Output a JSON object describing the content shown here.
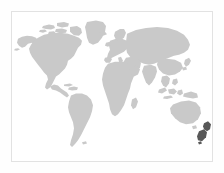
{
  "widget": {
    "name": "world-map-thumbnail",
    "type": "map",
    "projection": "equirectangular",
    "background_color": "#ffffff",
    "outer_background_color": "#fefefe",
    "border_color": "#e2e2e2",
    "border_width_px": 1,
    "frame": {
      "x": 11,
      "y": 11,
      "width": 202,
      "height": 151
    },
    "canvas": {
      "width": 224,
      "height": 173
    }
  },
  "map": {
    "land_color": "#c9c9c9",
    "highlight_color": "#585858",
    "ocean_color": "#ffffff",
    "graticule_visible": false,
    "labels_visible": false,
    "legend_visible": false,
    "regions": [
      {
        "id": "north-america",
        "label": "North America",
        "highlighted": false
      },
      {
        "id": "greenland",
        "label": "Greenland",
        "highlighted": false
      },
      {
        "id": "canadian-arctic",
        "label": "Canadian Arctic Archipelago",
        "highlighted": false
      },
      {
        "id": "south-america",
        "label": "South America",
        "highlighted": false
      },
      {
        "id": "africa",
        "label": "Africa",
        "highlighted": false
      },
      {
        "id": "europe",
        "label": "Europe",
        "highlighted": false
      },
      {
        "id": "asia",
        "label": "Asia",
        "highlighted": false
      },
      {
        "id": "india",
        "label": "India",
        "highlighted": false
      },
      {
        "id": "southeast-asia",
        "label": "Southeast Asia",
        "highlighted": false
      },
      {
        "id": "indonesia",
        "label": "Indonesia",
        "highlighted": false
      },
      {
        "id": "japan",
        "label": "Japan",
        "highlighted": false
      },
      {
        "id": "australia",
        "label": "Australia",
        "highlighted": false
      },
      {
        "id": "madagascar",
        "label": "Madagascar",
        "highlighted": false
      },
      {
        "id": "british-isles",
        "label": "British Isles",
        "highlighted": false
      },
      {
        "id": "iceland",
        "label": "Iceland",
        "highlighted": false
      },
      {
        "id": "new-zealand",
        "label": "New Zealand",
        "highlighted": true
      }
    ]
  }
}
